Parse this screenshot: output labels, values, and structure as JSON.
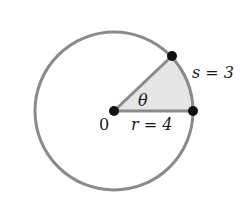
{
  "diagram": {
    "center_label": "0",
    "radius_label": "r = 4",
    "arc_label": "s = 3",
    "angle_label": "θ",
    "colors": {
      "circle": "#8a8a8a",
      "sector_fill": "#e6e6e6",
      "points": "#111111"
    }
  }
}
